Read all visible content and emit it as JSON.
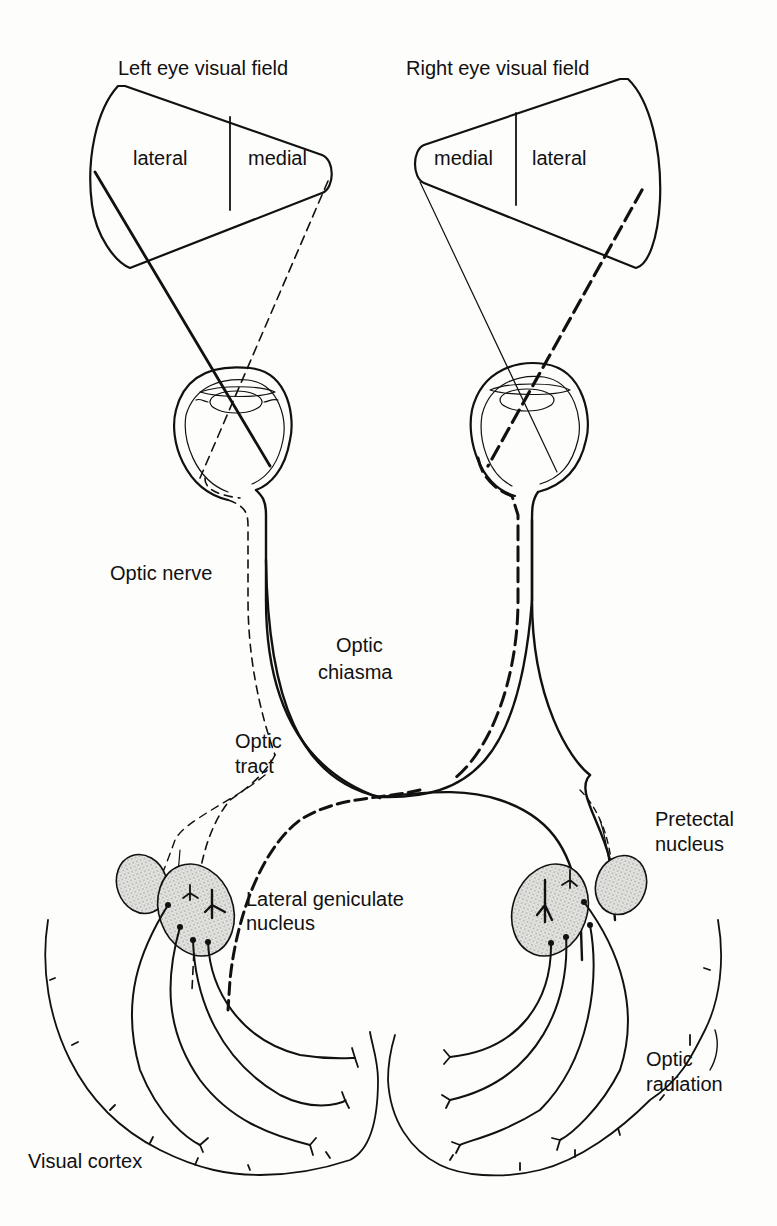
{
  "diagram": {
    "labels": {
      "left_field_title": "Left eye visual field",
      "right_field_title": "Right eye visual field",
      "left_lateral": "lateral",
      "left_medial": "medial",
      "right_medial": "medial",
      "right_lateral": "lateral",
      "optic_nerve": "Optic nerve",
      "optic_chiasma_1": "Optic",
      "optic_chiasma_2": "chiasma",
      "optic_tract_1": "Optic",
      "optic_tract_2": "tract",
      "pretectal_1": "Pretectal",
      "pretectal_2": "nucleus",
      "lgn_1": "Lateral geniculate",
      "lgn_2": "nucleus",
      "optic_radiation_1": "Optic",
      "optic_radiation_2": "radiation",
      "visual_cortex": "Visual cortex"
    },
    "colors": {
      "ink": "#111111",
      "background": "#fdfdfb",
      "stipple": "#d9d9d6"
    }
  }
}
